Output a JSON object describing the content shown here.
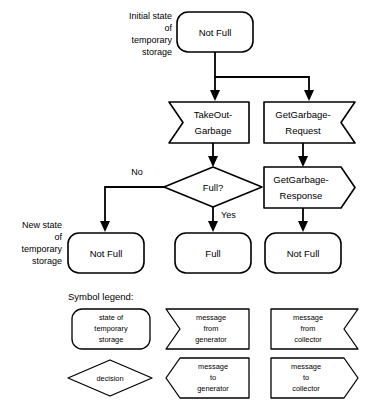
{
  "diagram": {
    "colors": {
      "stroke": "#000000",
      "fill": "#ffffff",
      "text": "#000000"
    },
    "annotations": {
      "initial_state": "Initial state\nof\ntemporary\nstorage",
      "initial_state_lines": [
        "Initial state",
        "of",
        "temporary",
        "storage"
      ],
      "new_state": "New state\nof\ntemporary\nstorage",
      "new_state_lines": [
        "New state",
        "of",
        "temporary",
        "storage"
      ]
    },
    "nodes": {
      "initial_not_full": "Not Full",
      "takeout_garbage_lines": [
        "TakeOut-",
        "Garbage"
      ],
      "getgarbage_request_lines": [
        "GetGarbage-",
        "Request"
      ],
      "getgarbage_response_lines": [
        "GetGarbage-",
        "Response"
      ],
      "decision_full": "Full?",
      "result_not_full_left": "Not Full",
      "result_full_middle": "Full",
      "result_not_full_right": "Not Full"
    },
    "branches": {
      "no": "No",
      "yes": "Yes"
    }
  },
  "legend": {
    "title": "Symbol legend:",
    "items": [
      {
        "shape": "rounded-rectangle",
        "lines": [
          "state of",
          "temporary",
          "storage"
        ]
      },
      {
        "shape": "notch-left-flag",
        "lines": [
          "message",
          "from",
          "generator"
        ]
      },
      {
        "shape": "notch-right-flag",
        "lines": [
          "message",
          "from",
          "collector"
        ]
      },
      {
        "shape": "diamond",
        "lines": [
          "decision"
        ]
      },
      {
        "shape": "point-left-arrow",
        "lines": [
          "message",
          "to",
          "generator"
        ]
      },
      {
        "shape": "point-right-arrow",
        "lines": [
          "message",
          "to",
          "collector"
        ]
      }
    ]
  }
}
